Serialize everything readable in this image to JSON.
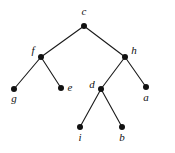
{
  "diagram": {
    "type": "tree-graph",
    "title": "",
    "background_color": "#ffffff",
    "node_color": "#111111",
    "edge_color": "#1a1a1a",
    "node_radius": 3,
    "nodes": [
      {
        "id": "c",
        "label": "c",
        "x": 84,
        "y": 26,
        "label_x": 84,
        "label_y": 15,
        "label_anchor": "middle"
      },
      {
        "id": "f",
        "label": "f",
        "x": 41,
        "y": 57,
        "label_x": 33,
        "label_y": 54,
        "label_anchor": "middle"
      },
      {
        "id": "h",
        "label": "h",
        "x": 125,
        "y": 57,
        "label_x": 134,
        "label_y": 54,
        "label_anchor": "middle"
      },
      {
        "id": "g",
        "label": "g",
        "x": 14,
        "y": 89,
        "label_x": 14,
        "label_y": 102,
        "label_anchor": "middle"
      },
      {
        "id": "e",
        "label": "e",
        "x": 61,
        "y": 88,
        "label_x": 70,
        "label_y": 91,
        "label_anchor": "middle"
      },
      {
        "id": "d",
        "label": "d",
        "x": 101,
        "y": 89,
        "label_x": 92,
        "label_y": 88,
        "label_anchor": "middle"
      },
      {
        "id": "a",
        "label": "a",
        "x": 146,
        "y": 87,
        "label_x": 146,
        "label_y": 101,
        "label_anchor": "middle"
      },
      {
        "id": "i",
        "label": "i",
        "x": 80,
        "y": 127,
        "label_x": 80,
        "label_y": 141,
        "label_anchor": "middle"
      },
      {
        "id": "b",
        "label": "b",
        "x": 122,
        "y": 127,
        "label_x": 122,
        "label_y": 141,
        "label_anchor": "middle"
      }
    ],
    "edges": [
      {
        "from": "c",
        "to": "f"
      },
      {
        "from": "c",
        "to": "h"
      },
      {
        "from": "f",
        "to": "g"
      },
      {
        "from": "f",
        "to": "e"
      },
      {
        "from": "h",
        "to": "d"
      },
      {
        "from": "h",
        "to": "a"
      },
      {
        "from": "d",
        "to": "i"
      },
      {
        "from": "d",
        "to": "b"
      }
    ]
  }
}
